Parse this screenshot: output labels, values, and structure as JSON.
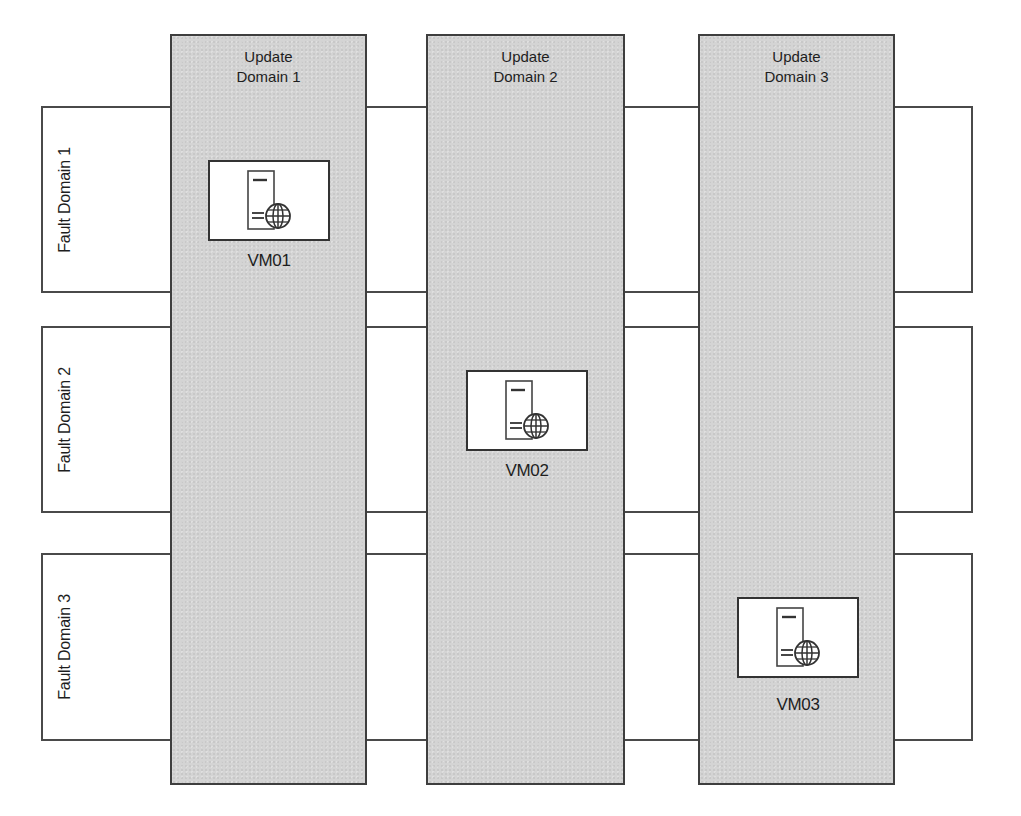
{
  "diagram": {
    "type": "availability-set-layout",
    "fault_domains": [
      {
        "id": "fd1",
        "label": "Fault Domain 1"
      },
      {
        "id": "fd2",
        "label": "Fault Domain 2"
      },
      {
        "id": "fd3",
        "label": "Fault Domain 3"
      }
    ],
    "update_domains": [
      {
        "id": "ud1",
        "label_line1": "Update",
        "label_line2": "Domain 1"
      },
      {
        "id": "ud2",
        "label_line1": "Update",
        "label_line2": "Domain 2"
      },
      {
        "id": "ud3",
        "label_line1": "Update",
        "label_line2": "Domain 3"
      }
    ],
    "vms": [
      {
        "label": "VM01",
        "fault_domain": "Fault Domain 1",
        "update_domain": "Update Domain 1",
        "icon": "server-globe-icon"
      },
      {
        "label": "VM02",
        "fault_domain": "Fault Domain 2",
        "update_domain": "Update Domain 2",
        "icon": "server-globe-icon"
      },
      {
        "label": "VM03",
        "fault_domain": "Fault Domain 3",
        "update_domain": "Update Domain 3",
        "icon": "server-globe-icon"
      }
    ],
    "colors": {
      "update_domain_fill": "#d4d4d4",
      "fault_domain_fill": "#ffffff",
      "border": "#3e3e3e"
    }
  }
}
